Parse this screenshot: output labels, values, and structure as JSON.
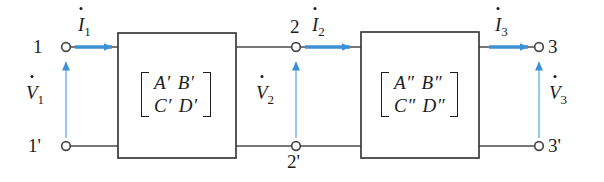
{
  "diagram": {
    "colors": {
      "wire": "#4a4a4a",
      "box_border": "#3a3a3a",
      "arrow_blue": "#3d8fd6",
      "text": "#1c1c1c",
      "background": "#ffffff"
    },
    "terminals": [
      {
        "id": "t1",
        "label": "1",
        "x": 66,
        "y": 47
      },
      {
        "id": "t1prime",
        "label": "1'",
        "x": 66,
        "y": 146
      },
      {
        "id": "t2",
        "label": "2",
        "x": 296,
        "y": 47
      },
      {
        "id": "t2prime",
        "label": "2'",
        "x": 296,
        "y": 146
      },
      {
        "id": "t3",
        "label": "3",
        "x": 539,
        "y": 47
      },
      {
        "id": "t3prime",
        "label": "3'",
        "x": 539,
        "y": 146
      }
    ],
    "currents": [
      {
        "id": "i1",
        "label": "I",
        "sub": "1"
      },
      {
        "id": "i2",
        "label": "I",
        "sub": "2"
      },
      {
        "id": "i3",
        "label": "I",
        "sub": "3"
      }
    ],
    "voltages": [
      {
        "id": "v1",
        "label": "V",
        "sub": "1"
      },
      {
        "id": "v2",
        "label": "V",
        "sub": "2"
      },
      {
        "id": "v3",
        "label": "V",
        "sub": "3"
      }
    ],
    "boxes": [
      {
        "id": "network-1",
        "matrix": {
          "row1": [
            "A′",
            "B′"
          ],
          "row2": [
            "C′",
            "D′"
          ]
        }
      },
      {
        "id": "network-2",
        "matrix": {
          "row1": [
            "A″",
            "B″"
          ],
          "row2": [
            "C″",
            "D″"
          ]
        }
      }
    ]
  }
}
